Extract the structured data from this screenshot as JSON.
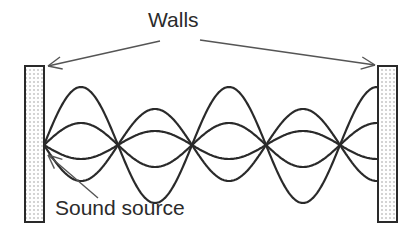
{
  "diagram": {
    "labels": {
      "walls": "Walls",
      "sound_source": "Sound source"
    },
    "colors": {
      "line": "#2a2a2a",
      "arrow": "#555555",
      "wall_fill": "#ffffff",
      "wall_dots": "#8a8a8a",
      "background": "#ffffff"
    },
    "walls": [
      {
        "name": "left-wall",
        "x": 25,
        "y": 66,
        "width": 19,
        "height": 156
      },
      {
        "name": "right-wall",
        "x": 378,
        "y": 66,
        "width": 19,
        "height": 156
      }
    ],
    "waves": {
      "axis_y": 145,
      "x_start": 44,
      "x_end": 378,
      "node_x": [
        44,
        118,
        192,
        266,
        340
      ],
      "amplitudes": [
        58,
        22,
        -14,
        -36
      ]
    },
    "arrows": [
      {
        "name": "walls-arrow-left",
        "from": [
          160,
          41
        ],
        "to": [
          48,
          66
        ]
      },
      {
        "name": "walls-arrow-right",
        "from": [
          200,
          40
        ],
        "to": [
          375,
          65
        ]
      },
      {
        "name": "sound-source-arrow",
        "from": [
          98,
          198
        ],
        "to": [
          48,
          155
        ]
      }
    ]
  }
}
